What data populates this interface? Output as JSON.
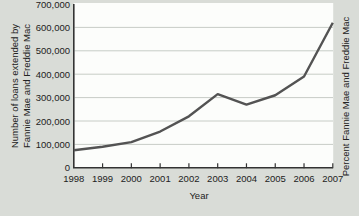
{
  "figure": {
    "colors": {
      "background": "#d9dcd7",
      "plot_background": "#fcfdfb",
      "grid": "#c7ccc6",
      "axis": "#333333",
      "line": "#535353",
      "text": "#222222"
    }
  },
  "chart_data": {
    "type": "line",
    "title": "",
    "xlabel": "Year",
    "ylabel_line1": "Number of loans extended by",
    "ylabel_line2": "Fannie Mae and Freddie Mac",
    "ylabel_right": "Percent Fannie Mae and Freddie Mac",
    "x": [
      1998,
      1999,
      2000,
      2001,
      2002,
      2003,
      2004,
      2005,
      2006,
      2007
    ],
    "series": [
      {
        "name": "Number of loans extended by Fannie Mae and Freddie Mac",
        "values": [
          75000,
          90000,
          110000,
          155000,
          220000,
          315000,
          270000,
          310000,
          390000,
          620000
        ]
      }
    ],
    "ylim": [
      0,
      700000
    ],
    "ytick_step": 100000,
    "ytick_labels": [
      "0",
      "100,000",
      "200,000",
      "300,000",
      "400,000",
      "500,000",
      "600,000",
      "700,000"
    ],
    "grid": true,
    "legend": "none"
  }
}
